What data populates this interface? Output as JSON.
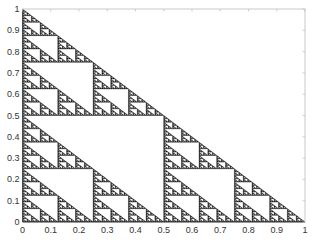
{
  "chart_data": {
    "type": "scatter",
    "title": "",
    "xlabel": "",
    "ylabel": "",
    "vertices": [
      [
        0,
        0
      ],
      [
        1,
        0
      ],
      [
        0,
        1
      ]
    ],
    "recursion_depth": 7,
    "xlim": [
      0,
      1
    ],
    "ylim": [
      0,
      1
    ],
    "xticks": [
      0,
      0.1,
      0.2,
      0.3,
      0.4,
      0.5,
      0.6,
      0.7,
      0.8,
      0.9,
      1
    ],
    "yticks": [
      0,
      0.1,
      0.2,
      0.3,
      0.4,
      0.5,
      0.6,
      0.7,
      0.8,
      0.9,
      1
    ],
    "xtick_labels": [
      "0",
      "0.1",
      "0.2",
      "0.3",
      "0.4",
      "0.5",
      "0.6",
      "0.7",
      "0.8",
      "0.9",
      "1"
    ],
    "ytick_labels": [
      "0",
      "0.1",
      "0.2",
      "0.3",
      "0.4",
      "0.5",
      "0.6",
      "0.7",
      "0.8",
      "0.9",
      "1"
    ],
    "grid": false,
    "legend": null,
    "colors": {
      "fill": "#1a1a1a",
      "axis": "#444444",
      "frame": "#bbbbbb"
    }
  }
}
